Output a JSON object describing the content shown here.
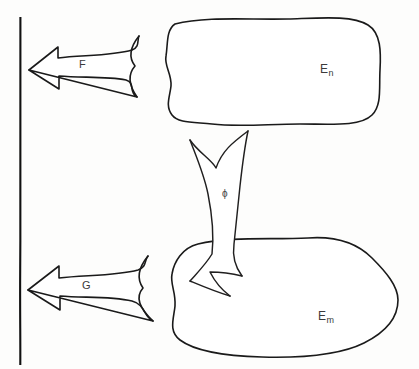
{
  "figure": {
    "background_color": "#fdfdfc",
    "ink_color": "#1a1a1a"
  },
  "wall": {
    "name": "vertical-boundary-line",
    "x": 20,
    "y_top": 17,
    "y_bottom": 365
  },
  "sets": [
    {
      "id": "en",
      "base": "E",
      "subscript": "n",
      "label": "E n",
      "position": "top-right",
      "label_x": 322,
      "label_y": 62
    },
    {
      "id": "em",
      "base": "E",
      "subscript": "m",
      "label": "E m",
      "position": "bottom-right",
      "label_x": 320,
      "label_y": 309
    }
  ],
  "arrows": [
    {
      "id": "f",
      "label": "F",
      "direction": "left",
      "from": "en",
      "to": "wall",
      "label_x": 83,
      "label_y": 65
    },
    {
      "id": "g",
      "label": "G",
      "direction": "left",
      "from": "em",
      "to": "wall",
      "label_x": 86,
      "label_y": 286
    },
    {
      "id": "phi",
      "label": "ϕ",
      "direction": "down",
      "from": "en",
      "to": "em",
      "label_x": 226,
      "label_y": 194
    }
  ]
}
